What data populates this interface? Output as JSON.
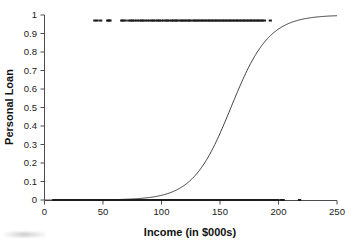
{
  "chart": {
    "title": "",
    "xlabel": "Income (in $000s)",
    "ylabel": "Personal Loan"
  },
  "chart_data": {
    "type": "scatter",
    "title": "",
    "xlabel": "Income (in $000s)",
    "ylabel": "Personal Loan",
    "xlim": [
      0,
      250
    ],
    "ylim": [
      0,
      1
    ],
    "xticks": [
      0,
      50,
      100,
      150,
      200,
      250
    ],
    "yticks": [
      0,
      0.1,
      0.2,
      0.3,
      0.4,
      0.5,
      0.6,
      0.7,
      0.8,
      0.9,
      1
    ],
    "xtick_labels": [
      "0",
      "50",
      "100",
      "150",
      "200",
      "250"
    ],
    "ytick_labels": [
      "0",
      "0.1",
      "0.2",
      "0.3",
      "0.4",
      "0.5",
      "0.6",
      "0.7",
      "0.8",
      "0.9",
      "1"
    ],
    "grid": false,
    "legend": null,
    "series": [
      {
        "name": "Fitted logistic curve",
        "type": "line",
        "color": "#3c3c3c",
        "model": "logistic",
        "intercept": -9.8,
        "slope": 0.0615,
        "midpoint_x": 159,
        "x_at_p05": 159,
        "y_at_x0": 0.0001,
        "y_at_x250": 0.97,
        "x": [
          0,
          10,
          20,
          30,
          40,
          50,
          60,
          70,
          80,
          90,
          100,
          110,
          120,
          130,
          140,
          150,
          160,
          170,
          180,
          190,
          200,
          210,
          220,
          230,
          240,
          250
        ],
        "y": [
          0.0001,
          0.0001,
          0.0002,
          0.0004,
          0.0007,
          0.0013,
          0.0024,
          0.0044,
          0.0081,
          0.0149,
          0.0271,
          0.0488,
          0.0859,
          0.1455,
          0.2349,
          0.3546,
          0.4923,
          0.6307,
          0.7494,
          0.8389,
          0.9002,
          0.9397,
          0.9643,
          0.9794,
          0.9884,
          0.9934
        ]
      },
      {
        "name": "Personal Loan = 1 (accepted)",
        "type": "points",
        "color": "#1c1c1c",
        "y_value": 0.97,
        "x": [
          43,
          45,
          48,
          54,
          55,
          56,
          66,
          67,
          69,
          72,
          74,
          75,
          77,
          79,
          81,
          83,
          84,
          86,
          88,
          90,
          92,
          93,
          95,
          97,
          98,
          100,
          102,
          104,
          105,
          107,
          109,
          110,
          112,
          113,
          115,
          117,
          118,
          120,
          121,
          123,
          124,
          126,
          128,
          129,
          131,
          132,
          134,
          135,
          137,
          138,
          140,
          141,
          143,
          144,
          146,
          147,
          149,
          150,
          152,
          153,
          155,
          156,
          158,
          159,
          161,
          162,
          164,
          165,
          167,
          168,
          170,
          171,
          173,
          174,
          176,
          177,
          179,
          180,
          182,
          183,
          185,
          186,
          188,
          193
        ]
      },
      {
        "name": "Personal Loan = 0 (declined)",
        "type": "points",
        "color": "#1c1c1c",
        "y_value": 0.0,
        "x": [
          8,
          10,
          12,
          14,
          15,
          17,
          19,
          20,
          22,
          24,
          25,
          27,
          28,
          30,
          31,
          33,
          34,
          36,
          37,
          39,
          40,
          42,
          43,
          45,
          46,
          48,
          49,
          50,
          52,
          53,
          54,
          56,
          57,
          58,
          60,
          61,
          62,
          64,
          65,
          66,
          68,
          69,
          70,
          72,
          73,
          74,
          76,
          77,
          79,
          80,
          82,
          83,
          85,
          86,
          88,
          89,
          91,
          92,
          94,
          95,
          97,
          98,
          100,
          101,
          103,
          104,
          106,
          107,
          109,
          110,
          112,
          113,
          115,
          116,
          118,
          119,
          121,
          122,
          124,
          125,
          127,
          128,
          130,
          131,
          133,
          134,
          136,
          137,
          139,
          140,
          142,
          143,
          145,
          146,
          148,
          149,
          151,
          152,
          154,
          155,
          157,
          158,
          160,
          161,
          163,
          164,
          166,
          167,
          169,
          170,
          172,
          173,
          175,
          176,
          178,
          179,
          181,
          182,
          184,
          185,
          187,
          188,
          190,
          191,
          193,
          195,
          197,
          199,
          202,
          204,
          218
        ]
      }
    ]
  }
}
